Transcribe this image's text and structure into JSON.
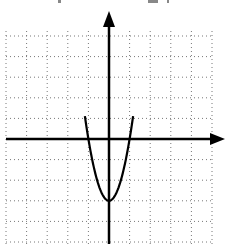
{
  "chart_data": {
    "type": "line",
    "title": "",
    "xlabel": "",
    "ylabel": "",
    "function": "y = 3x^2 - 3",
    "xlim": [
      -5,
      5
    ],
    "ylim": [
      -5,
      5.2
    ],
    "grid": true,
    "grid_style": "dotted",
    "grid_step": 1,
    "axes_arrows": [
      "positive-x",
      "positive-y"
    ],
    "series": [
      {
        "name": "parabola",
        "x": [
          -1.15,
          -1,
          -0.75,
          -0.5,
          -0.25,
          0,
          0.25,
          0.5,
          0.75,
          1,
          1.15
        ],
        "y": [
          0.97,
          0,
          -1.31,
          -2.25,
          -2.81,
          -3,
          -2.81,
          -2.25,
          -1.31,
          0,
          0.97
        ]
      }
    ],
    "key_points": {
      "vertex": [
        0,
        -3
      ],
      "x_intercepts": [
        [
          -1,
          0
        ],
        [
          1,
          0
        ]
      ]
    }
  },
  "colors": {
    "curve": "#000000",
    "axes": "#000000",
    "grid": "#777777",
    "background": "#ffffff"
  }
}
